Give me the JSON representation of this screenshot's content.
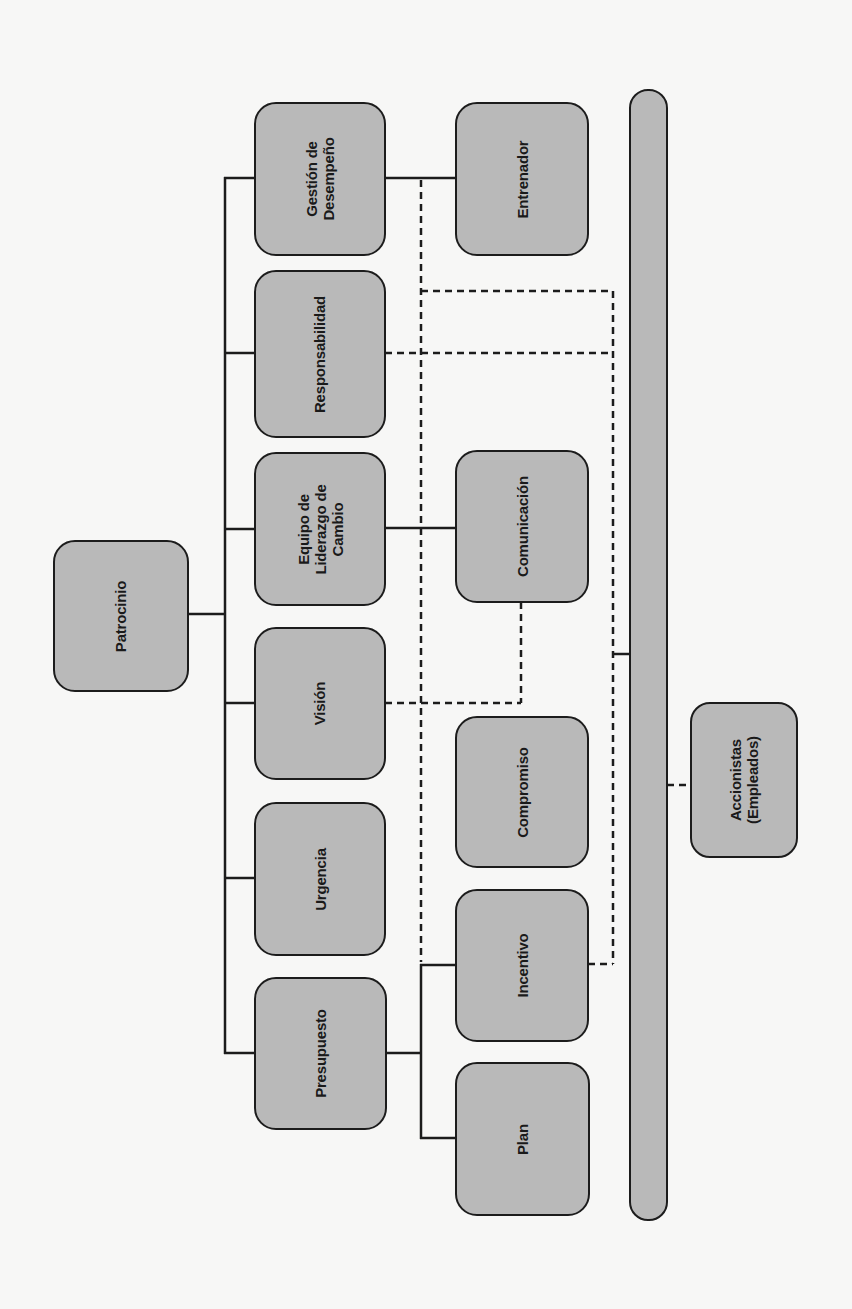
{
  "diagram": {
    "orientation": "rotated-90-ccw",
    "colors": {
      "background": "#f7f7f6",
      "node_fill": "#b9b9b9",
      "node_border": "#1c1c1c",
      "line": "#1c1c1c"
    },
    "root": {
      "id": "patrocinio",
      "label": "Patrocinio"
    },
    "primary_nodes": [
      {
        "id": "gestion",
        "label": "Gestión de\nDesempeño"
      },
      {
        "id": "responsabilidad",
        "label": "Responsabilidad"
      },
      {
        "id": "equipo",
        "label": "Equipo de\nLiderazgo de\nCambio"
      },
      {
        "id": "vision",
        "label": "Visión"
      },
      {
        "id": "urgencia",
        "label": "Urgencia"
      },
      {
        "id": "presupuesto",
        "label": "Presupuesto"
      }
    ],
    "secondary_nodes": [
      {
        "id": "entrenador",
        "label": "Entrenador"
      },
      {
        "id": "comunicacion",
        "label": "Comunicación"
      },
      {
        "id": "compromiso",
        "label": "Compromiso"
      },
      {
        "id": "incentivo",
        "label": "Incentivo"
      },
      {
        "id": "plan",
        "label": "Plan"
      }
    ],
    "bar": {
      "id": "channel-bar",
      "label": ""
    },
    "stakeholders": {
      "id": "accionistas",
      "label": "Accionistas\n(Empleados)"
    },
    "edges": [
      {
        "from": "patrocinio",
        "to": "gestion",
        "style": "solid"
      },
      {
        "from": "patrocinio",
        "to": "responsabilidad",
        "style": "solid"
      },
      {
        "from": "patrocinio",
        "to": "equipo",
        "style": "solid"
      },
      {
        "from": "patrocinio",
        "to": "vision",
        "style": "solid"
      },
      {
        "from": "patrocinio",
        "to": "urgencia",
        "style": "solid"
      },
      {
        "from": "patrocinio",
        "to": "presupuesto",
        "style": "solid"
      },
      {
        "from": "gestion",
        "to": "entrenador",
        "style": "solid"
      },
      {
        "from": "equipo",
        "to": "comunicacion",
        "style": "solid"
      },
      {
        "from": "presupuesto",
        "to": "incentivo",
        "style": "solid"
      },
      {
        "from": "presupuesto",
        "to": "plan",
        "style": "solid"
      },
      {
        "from": "responsabilidad",
        "to": "channel-bar",
        "style": "dashed"
      },
      {
        "from": "vision",
        "to": "comunicacion",
        "style": "dashed"
      },
      {
        "from": "incentivo",
        "to": "channel-bar",
        "style": "dashed"
      },
      {
        "from": "channel-bar",
        "to": "accionistas",
        "style": "dashed"
      }
    ]
  }
}
